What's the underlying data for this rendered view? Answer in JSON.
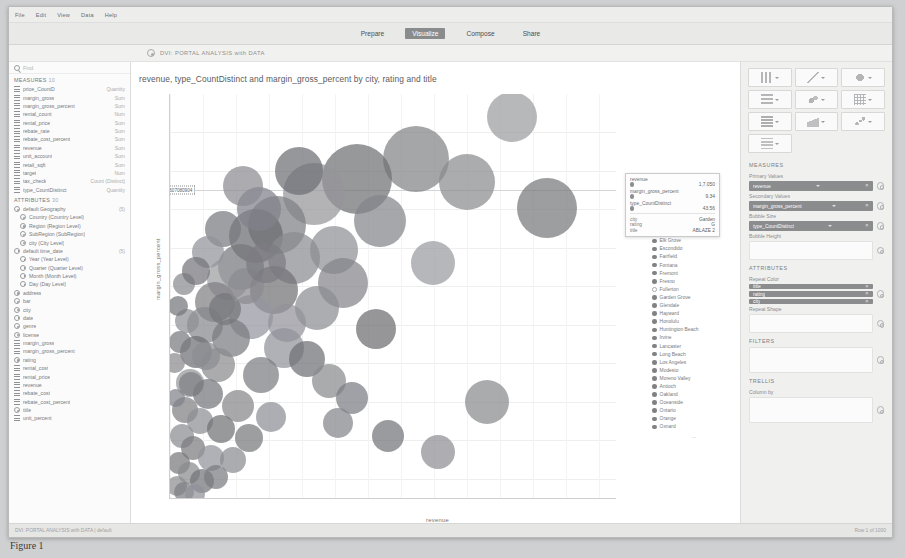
{
  "window": {
    "title": "DVI: PORTAL ANALYSIS with DATA",
    "doc_icon": "globe-icon"
  },
  "menubar": {
    "items": [
      "File",
      "Edit",
      "View",
      "Data",
      "Help"
    ]
  },
  "topbar": {
    "tabs": [
      "Prepare",
      "Visualize",
      "Compose",
      "Share"
    ],
    "active": "Visualize"
  },
  "left_panel": {
    "search_placeholder": "Find",
    "measures_header": "MEASURES",
    "measures_count": "10",
    "measures": [
      {
        "name": "price_CountD",
        "type": "Quantity"
      },
      {
        "name": "margin_gross",
        "type": "Sum"
      },
      {
        "name": "margin_gross_percent",
        "type": "Sum"
      },
      {
        "name": "rental_count",
        "type": "Num"
      },
      {
        "name": "rental_price",
        "type": "Sum"
      },
      {
        "name": "rebate_rate",
        "type": "Sum"
      },
      {
        "name": "rebate_cost_percent",
        "type": "Sum"
      },
      {
        "name": "revenue",
        "type": "Sum"
      },
      {
        "name": "unit_account",
        "type": "Sum"
      },
      {
        "name": "retail_sqft",
        "type": "Sum"
      },
      {
        "name": "target",
        "type": "Num"
      },
      {
        "name": "tax_check",
        "type": "Count (Distinct)"
      },
      {
        "name": "type_CountDistinct",
        "type": "Quantity"
      }
    ],
    "attributes_header": "ATTRIBUTES",
    "attributes_count": "30",
    "attributes": [
      {
        "name": "default Geography",
        "type": "(5)",
        "indent": false,
        "icon": "attr"
      },
      {
        "name": "Country (Country Level)",
        "type": "",
        "indent": true,
        "icon": "attr"
      },
      {
        "name": "Region (Region Level)",
        "type": "",
        "indent": true,
        "icon": "attr"
      },
      {
        "name": "SubRegion (SubRegion)",
        "type": "",
        "indent": true,
        "icon": "attr"
      },
      {
        "name": "city (City Level)",
        "type": "",
        "indent": true,
        "icon": "attr"
      },
      {
        "name": "default time_date",
        "type": "(5)",
        "indent": false,
        "icon": "clock"
      },
      {
        "name": "Year (Year Level)",
        "type": "",
        "indent": true,
        "icon": "clock"
      },
      {
        "name": "Quarter (Quarter Level)",
        "type": "",
        "indent": true,
        "icon": "clock"
      },
      {
        "name": "Month (Month Level)",
        "type": "",
        "indent": true,
        "icon": "clock"
      },
      {
        "name": "Day (Day Level)",
        "type": "",
        "indent": true,
        "icon": "clock"
      },
      {
        "name": "address",
        "type": "",
        "indent": false,
        "icon": "attr"
      },
      {
        "name": "bar",
        "type": "",
        "indent": false,
        "icon": "attr"
      },
      {
        "name": "city",
        "type": "",
        "indent": false,
        "icon": "attr"
      },
      {
        "name": "date",
        "type": "",
        "indent": false,
        "icon": "clock"
      },
      {
        "name": "genre",
        "type": "",
        "indent": false,
        "icon": "attr"
      },
      {
        "name": "license",
        "type": "",
        "indent": false,
        "icon": "attr"
      },
      {
        "name": "margin_gross",
        "type": "",
        "indent": false,
        "icon": "meas"
      },
      {
        "name": "margin_gross_percent",
        "type": "",
        "indent": false,
        "icon": "meas"
      },
      {
        "name": "rating",
        "type": "",
        "indent": false,
        "icon": "attr"
      },
      {
        "name": "rental_cost",
        "type": "",
        "indent": false,
        "icon": "meas"
      },
      {
        "name": "rental_price",
        "type": "",
        "indent": false,
        "icon": "meas"
      },
      {
        "name": "revenue",
        "type": "",
        "indent": false,
        "icon": "meas"
      },
      {
        "name": "rebate_cost",
        "type": "",
        "indent": false,
        "icon": "meas"
      },
      {
        "name": "rebate_cost_percent",
        "type": "",
        "indent": false,
        "icon": "meas"
      },
      {
        "name": "title",
        "type": "",
        "indent": false,
        "icon": "attr"
      },
      {
        "name": "unit_percent",
        "type": "",
        "indent": false,
        "icon": "meas"
      }
    ],
    "footer_note": "*attributes marked as Geography or Time"
  },
  "chart_data": {
    "type": "scatter",
    "title": "revenue, type_CountDistinct and margin_gross_percent by city, rating and title",
    "xlabel": "revenue",
    "ylabel": "margin_gross_percent",
    "xlim": [
      0,
      13500
    ],
    "ylim": [
      -3.0,
      18.0
    ],
    "xticks": [
      "0",
      "1000",
      "2000",
      "3000",
      "4000",
      "5000",
      "6000",
      "7000",
      "8000",
      "9000",
      "10000",
      "11000",
      "12000",
      "13000"
    ],
    "yticks": [
      "16.00",
      "14.00",
      "12.00",
      "10.00",
      "8.00",
      "6.00",
      "4.00",
      "2.00",
      "0.00",
      "-2.00"
    ],
    "grid": true,
    "size_measure": "type_CountDistinct",
    "color_measure": "city",
    "reference_line": {
      "value": "13.0304050607080904",
      "y": 13.03
    },
    "selected_xtick": "4770.35",
    "legend_position": "right",
    "legend_title": "city",
    "legend_more": "...",
    "legend": [
      {
        "label": "Bilbao",
        "filled": false
      },
      {
        "label": "Chula Vista",
        "filled": false
      },
      {
        "label": "Concord",
        "filled": true
      },
      {
        "label": "Corona",
        "filled": true
      },
      {
        "label": "Costa Mesa",
        "filled": true
      },
      {
        "label": "Daly City",
        "filled": false
      },
      {
        "label": "Downey",
        "filled": true
      },
      {
        "label": "El Monte",
        "filled": false
      },
      {
        "label": "Elk Grove",
        "filled": true
      },
      {
        "label": "Escondido",
        "filled": true
      },
      {
        "label": "Fairfield",
        "filled": true
      },
      {
        "label": "Fontana",
        "filled": true
      },
      {
        "label": "Fremont",
        "filled": true
      },
      {
        "label": "Fresno",
        "filled": true
      },
      {
        "label": "Fullerton",
        "filled": false
      },
      {
        "label": "Garden Grove",
        "filled": true
      },
      {
        "label": "Glendale",
        "filled": true
      },
      {
        "label": "Hayward",
        "filled": true
      },
      {
        "label": "Honolulu",
        "filled": true
      },
      {
        "label": "Huntington Beach",
        "filled": true
      },
      {
        "label": "Irvine",
        "filled": true
      },
      {
        "label": "Lancaster",
        "filled": true
      },
      {
        "label": "Long Beach",
        "filled": true
      },
      {
        "label": "Los Angeles",
        "filled": true
      },
      {
        "label": "Modesto",
        "filled": true
      },
      {
        "label": "Moreno Valley",
        "filled": true
      },
      {
        "label": "Antioch",
        "filled": true
      },
      {
        "label": "Oakland",
        "filled": true
      },
      {
        "label": "Oceanside",
        "filled": true
      },
      {
        "label": "Ontario",
        "filled": true
      },
      {
        "label": "Orange",
        "filled": true
      },
      {
        "label": "Oxnard",
        "filled": true
      }
    ],
    "points": [
      {
        "x": 10350,
        "y": 16.8,
        "r": 25,
        "c": "#9b9c9e"
      },
      {
        "x": 7450,
        "y": 14.6,
        "r": 33,
        "c": "#828385"
      },
      {
        "x": 9000,
        "y": 13.4,
        "r": 28,
        "c": "#8b8c8e"
      },
      {
        "x": 11400,
        "y": 12.1,
        "r": 30,
        "c": "#77787a"
      },
      {
        "x": 5650,
        "y": 13.6,
        "r": 35,
        "c": "#6f7072"
      },
      {
        "x": 4350,
        "y": 12.8,
        "r": 31,
        "c": "#95969a"
      },
      {
        "x": 6350,
        "y": 11.4,
        "r": 26,
        "c": "#84858a"
      },
      {
        "x": 3250,
        "y": 11.2,
        "r": 29,
        "c": "#7e7f83"
      },
      {
        "x": 4950,
        "y": 9.9,
        "r": 24,
        "c": "#8f9094"
      },
      {
        "x": 2600,
        "y": 10.6,
        "r": 27,
        "c": "#6a6b6f"
      },
      {
        "x": 7950,
        "y": 9.2,
        "r": 22,
        "c": "#9a9b9f"
      },
      {
        "x": 3750,
        "y": 9.5,
        "r": 26,
        "c": "#8b8c90"
      },
      {
        "x": 2150,
        "y": 9.0,
        "r": 23,
        "c": "#76777b"
      },
      {
        "x": 5250,
        "y": 8.2,
        "r": 25,
        "c": "#83848a"
      },
      {
        "x": 1750,
        "y": 8.4,
        "r": 21,
        "c": "#9b9ca0"
      },
      {
        "x": 3150,
        "y": 7.8,
        "r": 24,
        "c": "#717276"
      },
      {
        "x": 4450,
        "y": 6.9,
        "r": 22,
        "c": "#8c8d91"
      },
      {
        "x": 1350,
        "y": 7.2,
        "r": 20,
        "c": "#7f8084"
      },
      {
        "x": 2450,
        "y": 6.4,
        "r": 22,
        "c": "#9495a0"
      },
      {
        "x": 6250,
        "y": 5.8,
        "r": 20,
        "c": "#6d6e72"
      },
      {
        "x": 1050,
        "y": 6.0,
        "r": 18,
        "c": "#87888c"
      },
      {
        "x": 1850,
        "y": 5.3,
        "r": 19,
        "c": "#7a7b7f"
      },
      {
        "x": 3450,
        "y": 4.8,
        "r": 20,
        "c": "#92939a"
      },
      {
        "x": 800,
        "y": 4.6,
        "r": 16,
        "c": "#6e6f73"
      },
      {
        "x": 1450,
        "y": 3.9,
        "r": 17,
        "c": "#8a8b8f"
      },
      {
        "x": 2750,
        "y": 3.4,
        "r": 18,
        "c": "#7c7d81"
      },
      {
        "x": 9600,
        "y": 2.0,
        "r": 22,
        "c": "#898a8e"
      },
      {
        "x": 600,
        "y": 3.0,
        "r": 14,
        "c": "#949599"
      },
      {
        "x": 1150,
        "y": 2.4,
        "r": 15,
        "c": "#75767a"
      },
      {
        "x": 2050,
        "y": 1.8,
        "r": 16,
        "c": "#86878b"
      },
      {
        "x": 450,
        "y": 1.6,
        "r": 13,
        "c": "#7f8084"
      },
      {
        "x": 900,
        "y": 1.0,
        "r": 13,
        "c": "#8e8f93"
      },
      {
        "x": 1550,
        "y": 0.6,
        "r": 14,
        "c": "#707175"
      },
      {
        "x": 350,
        "y": 0.2,
        "r": 12,
        "c": "#8b8c90"
      },
      {
        "x": 700,
        "y": -0.4,
        "r": 12,
        "c": "#7b7c80"
      },
      {
        "x": 1250,
        "y": -0.9,
        "r": 13,
        "c": "#92939b"
      },
      {
        "x": 260,
        "y": -1.2,
        "r": 11,
        "c": "#78797d"
      },
      {
        "x": 560,
        "y": -1.7,
        "r": 11,
        "c": "#898a8e"
      },
      {
        "x": 980,
        "y": -2.1,
        "r": 12,
        "c": "#737478"
      },
      {
        "x": 200,
        "y": -2.4,
        "r": 10,
        "c": "#8d8e92"
      },
      {
        "x": 430,
        "y": -2.7,
        "r": 10,
        "c": "#7d7e82"
      },
      {
        "x": 760,
        "y": -2.8,
        "r": 10,
        "c": "#90919a"
      },
      {
        "x": 150,
        "y": 4.0,
        "r": 10,
        "c": "#8a8b8f"
      },
      {
        "x": 300,
        "y": 5.1,
        "r": 11,
        "c": "#797a7e"
      },
      {
        "x": 520,
        "y": 6.2,
        "r": 12,
        "c": "#8f9094"
      },
      {
        "x": 250,
        "y": 7.0,
        "r": 10,
        "c": "#75767a"
      },
      {
        "x": 420,
        "y": 8.1,
        "r": 11,
        "c": "#898a8f"
      },
      {
        "x": 180,
        "y": 2.2,
        "r": 9,
        "c": "#81828a"
      },
      {
        "x": 640,
        "y": 2.9,
        "r": 12,
        "c": "#7e7f83"
      },
      {
        "x": 1100,
        "y": 4.4,
        "r": 14,
        "c": "#8c8d92"
      },
      {
        "x": 1650,
        "y": 6.8,
        "r": 16,
        "c": "#757679"
      },
      {
        "x": 2300,
        "y": 8.0,
        "r": 18,
        "c": "#8a8b90"
      },
      {
        "x": 2900,
        "y": 9.2,
        "r": 20,
        "c": "#7b7c82"
      },
      {
        "x": 3550,
        "y": 6.1,
        "r": 19,
        "c": "#91929a"
      },
      {
        "x": 4150,
        "y": 4.2,
        "r": 18,
        "c": "#6f7074"
      },
      {
        "x": 4800,
        "y": 3.1,
        "r": 17,
        "c": "#898a8e"
      },
      {
        "x": 5500,
        "y": 2.2,
        "r": 16,
        "c": "#7c7d83"
      },
      {
        "x": 3050,
        "y": 1.2,
        "r": 15,
        "c": "#8e8f95"
      },
      {
        "x": 2400,
        "y": 0.1,
        "r": 14,
        "c": "#77787c"
      },
      {
        "x": 1900,
        "y": -1.0,
        "r": 13,
        "c": "#8b8c91"
      },
      {
        "x": 1400,
        "y": -1.9,
        "r": 12,
        "c": "#7a7b7f"
      },
      {
        "x": 5100,
        "y": 0.9,
        "r": 15,
        "c": "#84858b"
      },
      {
        "x": 6600,
        "y": 0.2,
        "r": 16,
        "c": "#73747a"
      },
      {
        "x": 8100,
        "y": -0.6,
        "r": 17,
        "c": "#8d8e94"
      },
      {
        "x": 2700,
        "y": 12.0,
        "r": 22,
        "c": "#80818a"
      },
      {
        "x": 3900,
        "y": 14.0,
        "r": 24,
        "c": "#6e6f75"
      },
      {
        "x": 2200,
        "y": 13.2,
        "r": 20,
        "c": "#8a8b91"
      },
      {
        "x": 1600,
        "y": 11.0,
        "r": 18,
        "c": "#797a80"
      },
      {
        "x": 1150,
        "y": 9.8,
        "r": 16,
        "c": "#92939a"
      },
      {
        "x": 800,
        "y": 8.8,
        "r": 14,
        "c": "#74757b"
      }
    ]
  },
  "tooltip": {
    "rows": [
      {
        "name": "revenue",
        "value": "1,7.050"
      },
      {
        "name": "margin_gross_percent",
        "value": "9.34"
      },
      {
        "name": "type_CountDistinct",
        "value": "43.56"
      }
    ],
    "details": [
      {
        "key": "city",
        "value": "Garden"
      },
      {
        "key": "rating",
        "value": "G"
      },
      {
        "key": "title",
        "value": "ABLAZE 2"
      }
    ]
  },
  "right_panel": {
    "viz_buttons": [
      "bar-chart-icon",
      "line-chart-icon",
      "pie-chart-icon",
      "column-chart-icon",
      "bubble-chart-icon",
      "heatmap-icon",
      "grid-chart-icon",
      "area-chart-icon",
      "scatter-chart-icon",
      "table-icon"
    ],
    "measures_header": "MEASURES",
    "primary_values_label": "Primary Values",
    "primary_values": "revenue",
    "secondary_values_label": "Secondary Values",
    "secondary_values": "margin_gross_percent",
    "bubble_size_label": "Bubble Size",
    "bubble_size": "type_CountDistinct",
    "bubble_height_label": "Bubble Height",
    "attributes_header": "ATTRIBUTES",
    "repeat_color_label": "Repeat Color",
    "repeat_color": [
      "title",
      "rating",
      "city"
    ],
    "repeat_shape_label": "Repeat Shape",
    "filters_header": "FILTERS",
    "trellis_header": "TRELLIS",
    "column_by_label": "Column by"
  },
  "statusbar": {
    "function_btn": "f",
    "modes": [
      "grid-view-icon",
      "chart-view-icon"
    ],
    "page_label": "100%",
    "next_arrow": "›"
  },
  "bottombar": {
    "left": "DVI: PORTAL ANALYSIS with DATA | default",
    "right": "Row 1 of 1000"
  },
  "caption": "Figure 1"
}
